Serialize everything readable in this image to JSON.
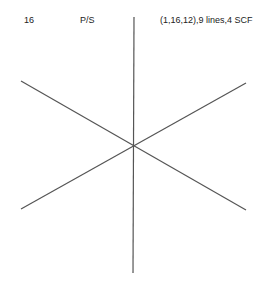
{
  "header": {
    "index": "16",
    "type": "P/S",
    "description": "(1,16,12),9 lines,4 SCF"
  },
  "diagram": {
    "line_color": "#555555",
    "center": [
      133,
      146
    ],
    "lines": [
      {
        "name": "vertical",
        "x1": 134,
        "y1": 17,
        "x2": 133,
        "y2": 273
      },
      {
        "name": "diag-down",
        "x1": 21,
        "y1": 81,
        "x2": 246,
        "y2": 210
      },
      {
        "name": "diag-up",
        "x1": 21,
        "y1": 209,
        "x2": 246,
        "y2": 83
      }
    ]
  }
}
